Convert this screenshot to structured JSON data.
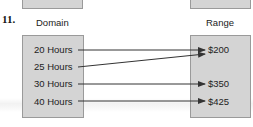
{
  "problem_number": "11.",
  "domain": {
    "heading": "Domain",
    "items": [
      "20 Hours",
      "25 Hours",
      "30 Hours",
      "40 Hours"
    ]
  },
  "range": {
    "heading": "Range",
    "items": [
      "$200",
      "$350",
      "$425"
    ]
  },
  "mappings": [
    {
      "from": "20 Hours",
      "to": "$200"
    },
    {
      "from": "25 Hours",
      "to": "$200"
    },
    {
      "from": "30 Hours",
      "to": "$350"
    },
    {
      "from": "40 Hours",
      "to": "$425"
    }
  ],
  "colors": {
    "box_fill": "#d4d4d4",
    "box_border": "#9a9a9a",
    "arrow": "#333333"
  }
}
